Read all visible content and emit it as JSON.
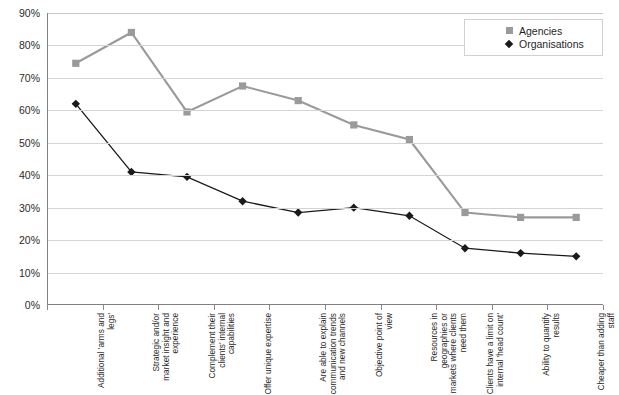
{
  "chart_data": {
    "type": "line",
    "title": "",
    "subtitle": "",
    "xlabel": "",
    "ylabel": "",
    "ylim": [
      0,
      90
    ],
    "y_ticks": [
      "0%",
      "10%",
      "20%",
      "30%",
      "40%",
      "50%",
      "60%",
      "70%",
      "80%",
      "90%"
    ],
    "y_tick_values": [
      0,
      10,
      20,
      30,
      40,
      50,
      60,
      70,
      80,
      90
    ],
    "grid": true,
    "legend_position": "top-right",
    "categories": [
      "Additional 'arms and legs'",
      "Strategic and/or market insight and experience",
      "Complement their clients' internal capabilities",
      "Offer unique expertise",
      "Are able to explain communication trends and new channels",
      "Objective point of view",
      "Resources in geographies or markets where clients need them",
      "Clients have a limit on internal 'head count'",
      "Ability to quantify results",
      "Cheaper than adding staff"
    ],
    "series": [
      {
        "name": "Agencies",
        "color": "#9a9a9a",
        "marker": "square",
        "values": [
          74.5,
          84,
          59.5,
          67.5,
          63,
          55.5,
          51,
          28.5,
          27,
          27
        ]
      },
      {
        "name": "Organisations",
        "color": "#1a1a1a",
        "marker": "diamond",
        "values": [
          62,
          41,
          39.5,
          32,
          28.5,
          30,
          27.5,
          17.5,
          16,
          15
        ]
      }
    ]
  },
  "legend": {
    "items": [
      {
        "label": "Agencies",
        "marker": "square-marker-icon"
      },
      {
        "label": "Organisations",
        "marker": "diamond-marker-icon"
      }
    ]
  },
  "colors": {
    "agencies": "#9a9a9a",
    "organisations": "#1a1a1a",
    "gridline": "#d4d4d4",
    "axis": "#808080",
    "background": "#ffffff"
  }
}
